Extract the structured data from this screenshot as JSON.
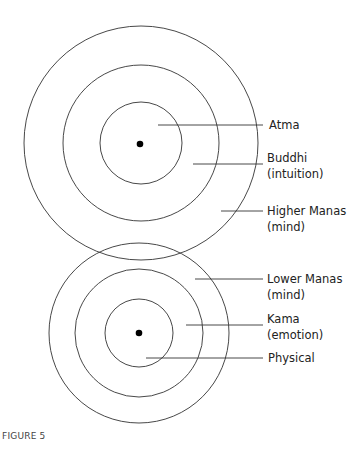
{
  "caption": "FIGURE 5",
  "colors": {
    "stroke": "#333333",
    "text": "#222222",
    "dot": "#000000"
  },
  "upper_figure": {
    "center": [
      141,
      143
    ],
    "radii": [
      117,
      78,
      41
    ],
    "labels": [
      {
        "line1": "Atma",
        "line2": "",
        "line_y": 125,
        "line_x1": 158,
        "label_y": 117
      },
      {
        "line1": "Buddhi",
        "line2": "(intuition)",
        "line_y": 164,
        "line_x1": 193,
        "label_y": 150
      },
      {
        "line1": "Higher Manas",
        "line2": "(mind)",
        "line_y": 211,
        "line_x1": 221,
        "label_y": 203
      }
    ]
  },
  "lower_figure": {
    "center": [
      139,
      333
    ],
    "radii": [
      90,
      64,
      34
    ],
    "labels": [
      {
        "line1": "Lower Manas",
        "line2": "(mind)",
        "line_y": 279,
        "line_x1": 195,
        "label_y": 271
      },
      {
        "line1": "Kama",
        "line2": "(emotion)",
        "line_y": 325,
        "line_x1": 186,
        "label_y": 311
      },
      {
        "line1": "Physical",
        "line2": "",
        "line_y": 358,
        "line_x1": 146,
        "label_y": 350
      }
    ]
  }
}
